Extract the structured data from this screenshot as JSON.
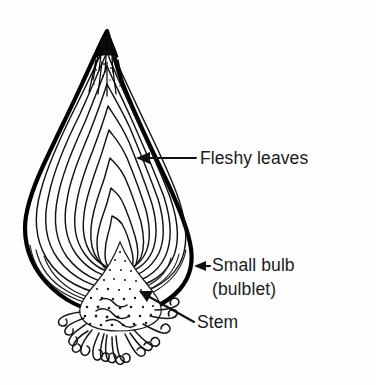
{
  "figure": {
    "subject": "bulb",
    "background_color": "#fefefe",
    "ink_color": "#111111",
    "width": 376,
    "height": 385
  },
  "labels": [
    {
      "id": "fleshy-leaves",
      "text": "Fleshy leaves",
      "lines": [
        "Fleshy leaves"
      ],
      "text_x": 200,
      "text_y": 164,
      "leader": {
        "from_x": 196,
        "from_y": 158,
        "to_x": 140,
        "to_y": 158
      },
      "arrow": {
        "x": 138,
        "y": 158,
        "direction": "left"
      }
    },
    {
      "id": "small-bulb",
      "text": "Small bulb (bulblet)",
      "lines": [
        "Small bulb",
        "(bulblet)"
      ],
      "text_x": 212,
      "text_y": 271,
      "line2_y": 295,
      "leader": {
        "from_x": 208,
        "from_y": 266,
        "to_x": 198,
        "to_y": 266
      },
      "arrow": {
        "x": 196,
        "y": 266,
        "direction": "left"
      }
    },
    {
      "id": "stem",
      "text": "Stem",
      "lines": [
        "Stem"
      ],
      "text_x": 197,
      "text_y": 328,
      "leader": {
        "from_x": 193,
        "from_y": 321,
        "to_x": 143,
        "to_y": 293
      },
      "arrow": {
        "x": 143,
        "y": 293,
        "direction": "upper-left"
      }
    }
  ],
  "anatomy": {
    "apex": {
      "x": 107,
      "y": 31,
      "description": "pointed dark tip of bulb"
    },
    "widest": {
      "left_x": 25,
      "right_x": 190,
      "y": 212
    },
    "base_plate": {
      "x": 120,
      "y": 300,
      "description": "stem / basal plate"
    },
    "root_span": {
      "left_x": 74,
      "right_x": 176,
      "bottom_y": 362
    },
    "scale_layer_count": 9,
    "root_filament_count": 16
  }
}
